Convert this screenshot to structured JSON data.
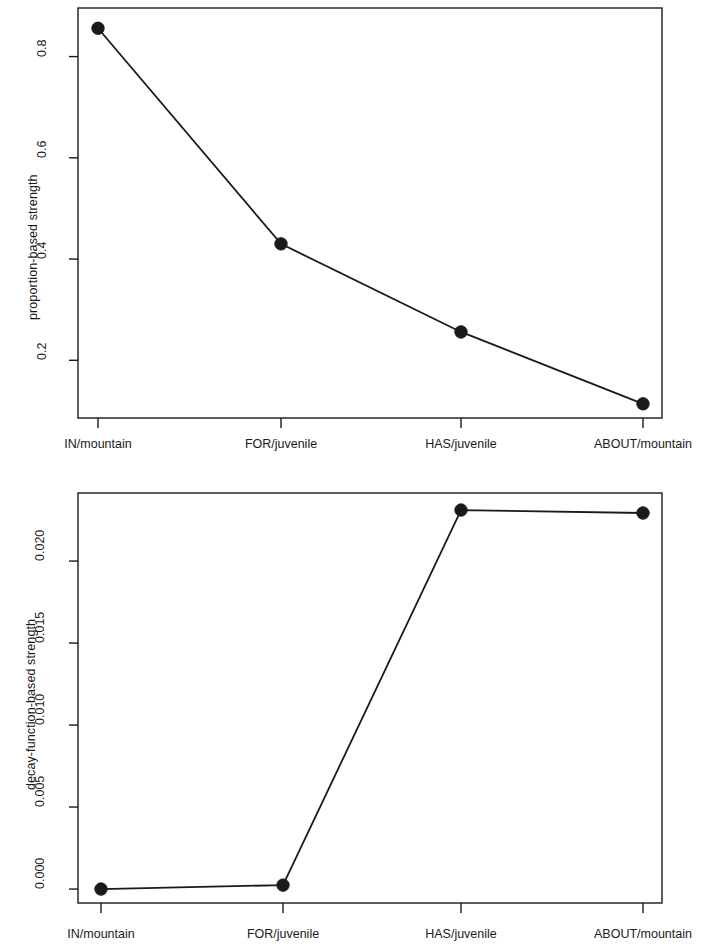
{
  "figure": {
    "background": "#ffffff",
    "ink_color": "#1a1a1a",
    "panel_count": 2
  },
  "chart_data": [
    {
      "type": "line",
      "panel": "top",
      "title": "",
      "xlabel": "",
      "ylabel": "proportion-based strength",
      "categories": [
        "IN/mountain",
        "FOR/juvenile",
        "HAS/juvenile",
        "ABOUT/mountain"
      ],
      "values": [
        0.856,
        0.43,
        0.256,
        0.114
      ],
      "ytick_labels": [
        "0.2",
        "0.4",
        "0.6",
        "0.8"
      ],
      "ytick_values": [
        0.2,
        0.4,
        0.6,
        0.8
      ],
      "ylim": [
        0.086,
        0.896
      ],
      "grid": false,
      "legend": "none",
      "marker": "filled-circle",
      "line_color": "#1a1a1a",
      "marker_color": "#1a1a1a"
    },
    {
      "type": "line",
      "panel": "bottom",
      "title": "",
      "xlabel": "",
      "ylabel": "decay-function-based strength",
      "categories": [
        "IN/mountain",
        "FOR/juvenile",
        "HAS/juvenile",
        "ABOUT/mountain"
      ],
      "values": [
        0.0,
        0.00024,
        0.02311,
        0.02293
      ],
      "ytick_labels": [
        "0.000",
        "0.005",
        "0.010",
        "0.015",
        "0.020"
      ],
      "ytick_values": [
        0.0,
        0.005,
        0.01,
        0.015,
        0.02
      ],
      "ylim": [
        -0.00085,
        0.02415
      ],
      "grid": false,
      "legend": "none",
      "marker": "filled-circle",
      "line_color": "#1a1a1a",
      "marker_color": "#1a1a1a"
    }
  ]
}
